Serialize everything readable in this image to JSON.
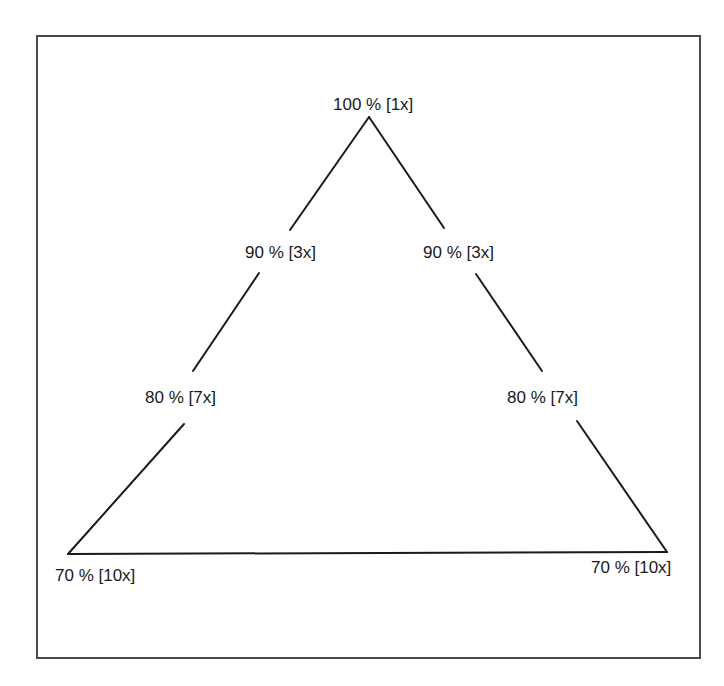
{
  "diagram": {
    "type": "triangle-scale",
    "stroke_color": "#1a1a1a",
    "frame_color": "#4a4a4a",
    "apex": {
      "label": "100 % [1x]",
      "percent": 100,
      "multiplier": "1x"
    },
    "left_side": [
      {
        "label": "90 % [3x]",
        "percent": 90,
        "multiplier": "3x"
      },
      {
        "label": "80 % [7x]",
        "percent": 80,
        "multiplier": "7x"
      },
      {
        "label": "70 % [10x]",
        "percent": 70,
        "multiplier": "10x"
      }
    ],
    "right_side": [
      {
        "label": "90 % [3x]",
        "percent": 90,
        "multiplier": "3x"
      },
      {
        "label": "80 % [7x]",
        "percent": 80,
        "multiplier": "7x"
      },
      {
        "label": "70 % [10x]",
        "percent": 70,
        "multiplier": "10x"
      }
    ],
    "segments": [
      {
        "id": "left-upper",
        "x1": 369,
        "y1": 117,
        "x2": 290,
        "y2": 230
      },
      {
        "id": "right-upper",
        "x1": 369,
        "y1": 117,
        "x2": 444,
        "y2": 228
      },
      {
        "id": "left-middle",
        "x1": 259,
        "y1": 273,
        "x2": 193,
        "y2": 371
      },
      {
        "id": "right-middle",
        "x1": 476,
        "y1": 274,
        "x2": 542,
        "y2": 371
      },
      {
        "id": "left-lower",
        "x1": 184,
        "y1": 424,
        "x2": 68,
        "y2": 554
      },
      {
        "id": "right-lower",
        "x1": 577,
        "y1": 421,
        "x2": 667,
        "y2": 552
      },
      {
        "id": "base",
        "x1": 68,
        "y1": 554,
        "x2": 667,
        "y2": 552
      }
    ]
  }
}
